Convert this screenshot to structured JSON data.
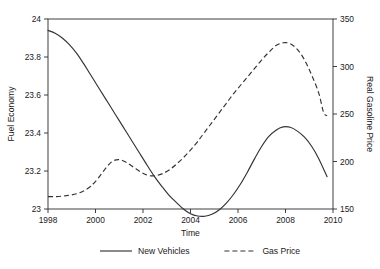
{
  "chart_data": {
    "type": "line",
    "title": "",
    "xlabel": "Time",
    "ylabel": "Fuel Economy",
    "y2label": "Real Gasoline Price",
    "xlim": [
      1998,
      2010
    ],
    "ylim": [
      23,
      24
    ],
    "y2lim": [
      150,
      350
    ],
    "grid": false,
    "legend_position": "below",
    "xticks": [
      1998,
      2000,
      2002,
      2004,
      2006,
      2008,
      2010
    ],
    "xticklabels": [
      "1998",
      "2000",
      "2002",
      "2004",
      "2006",
      "2008",
      "2010"
    ],
    "yticks": [
      23,
      23.2,
      23.4,
      23.6,
      23.8,
      24
    ],
    "yticklabels": [
      "23",
      "23.2",
      "23.4",
      "23.6",
      "23.8",
      "24"
    ],
    "y2ticks": [
      150,
      200,
      250,
      300,
      350
    ],
    "y2ticklabels": [
      "150",
      "200",
      "250",
      "300",
      "350"
    ],
    "series": [
      {
        "name": "New Vehicles",
        "axis": "left",
        "style": "solid",
        "x": [
          1998.0,
          1998.3,
          1998.6,
          1998.9,
          1999.2,
          1999.5,
          1999.8,
          2000.1,
          2000.4,
          2000.7,
          2001.0,
          2001.3,
          2001.6,
          2001.9,
          2002.2,
          2002.5,
          2002.8,
          2003.1,
          2003.4,
          2003.7,
          2004.0,
          2004.3,
          2004.6,
          2004.9,
          2005.2,
          2005.5,
          2005.8,
          2006.1,
          2006.4,
          2006.7,
          2007.0,
          2007.3,
          2007.6,
          2007.9,
          2008.2,
          2008.5,
          2008.8,
          2009.1,
          2009.4,
          2009.75
        ],
        "y": [
          23.94,
          23.925,
          23.9,
          23.865,
          23.82,
          23.765,
          23.705,
          23.645,
          23.585,
          23.525,
          23.465,
          23.405,
          23.345,
          23.285,
          23.225,
          23.168,
          23.118,
          23.072,
          23.035,
          23.0,
          22.975,
          22.963,
          22.962,
          22.972,
          22.995,
          23.03,
          23.075,
          23.13,
          23.195,
          23.265,
          23.33,
          23.382,
          23.415,
          23.432,
          23.43,
          23.41,
          23.378,
          23.33,
          23.265,
          23.17
        ]
      },
      {
        "name": "Gas Price",
        "axis": "right",
        "style": "dashed",
        "x": [
          1998.0,
          1998.3,
          1998.6,
          1998.9,
          1999.2,
          1999.5,
          1999.8,
          2000.1,
          2000.4,
          2000.7,
          2001.0,
          2001.3,
          2001.6,
          2001.9,
          2002.2,
          2002.5,
          2002.8,
          2003.1,
          2003.4,
          2003.7,
          2004.0,
          2004.3,
          2004.6,
          2004.9,
          2005.2,
          2005.5,
          2005.8,
          2006.1,
          2006.4,
          2006.7,
          2007.0,
          2007.3,
          2007.6,
          2007.9,
          2008.2,
          2008.5,
          2008.8,
          2009.1,
          2009.4,
          2009.6,
          2009.75
        ],
        "y": [
          163,
          163,
          163.5,
          164.5,
          166,
          169,
          174,
          182,
          192,
          200,
          202,
          199,
          194,
          189,
          185.5,
          185,
          187,
          191,
          197,
          204,
          212,
          221,
          231,
          241,
          251,
          261,
          271,
          280,
          289,
          298,
          307,
          315,
          322,
          325,
          324,
          318,
          307,
          291,
          272,
          252,
          248
        ]
      }
    ]
  },
  "legend": {
    "items": [
      {
        "label": "New Vehicles",
        "style": "solid"
      },
      {
        "label": "Gas Price",
        "style": "dashed"
      }
    ]
  }
}
